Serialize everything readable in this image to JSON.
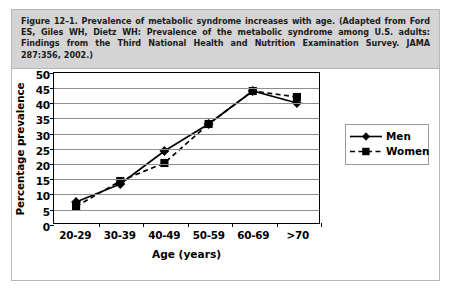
{
  "figure": {
    "caption": "Figure 12–1. Prevalence of metabolic syndrome increases with age. (Adapted from Ford ES, Giles WH, Dietz WH: Prevalence of the metabolic syndrome among U.S. adults: Findings from the Third National Health and Nutrition Examination Survey. JAMA 287:356, 2002.)"
  },
  "chart_data": {
    "type": "line",
    "title": "",
    "xlabel": "Age (years)",
    "ylabel": "Percentage prevalence",
    "categories": [
      "20-29",
      "30-39",
      "40-49",
      "50-59",
      "60-69",
      ">70"
    ],
    "ylim": [
      0,
      50
    ],
    "ytick_step": 5,
    "yticks": [
      "50",
      "45",
      "40",
      "35",
      "30",
      "25",
      "20",
      "15",
      "10",
      "5",
      "0"
    ],
    "grid": true,
    "legend_position": "right",
    "series": [
      {
        "name": "Men",
        "values": [
          7,
          13,
          24,
          33,
          44,
          40
        ],
        "line_style": "solid",
        "marker": "diamond",
        "color": "#000000"
      },
      {
        "name": "Women",
        "values": [
          5.5,
          14,
          20,
          33,
          44,
          42
        ],
        "line_style": "dashed",
        "marker": "square",
        "color": "#000000"
      }
    ]
  },
  "legend": {
    "entries": [
      {
        "label": "Men"
      },
      {
        "label": "Women"
      }
    ]
  },
  "colors": {
    "caption_background": "#d4d4d4",
    "plot_border": "#000000",
    "gridline": "#8d8d8d",
    "series": "#000000"
  }
}
